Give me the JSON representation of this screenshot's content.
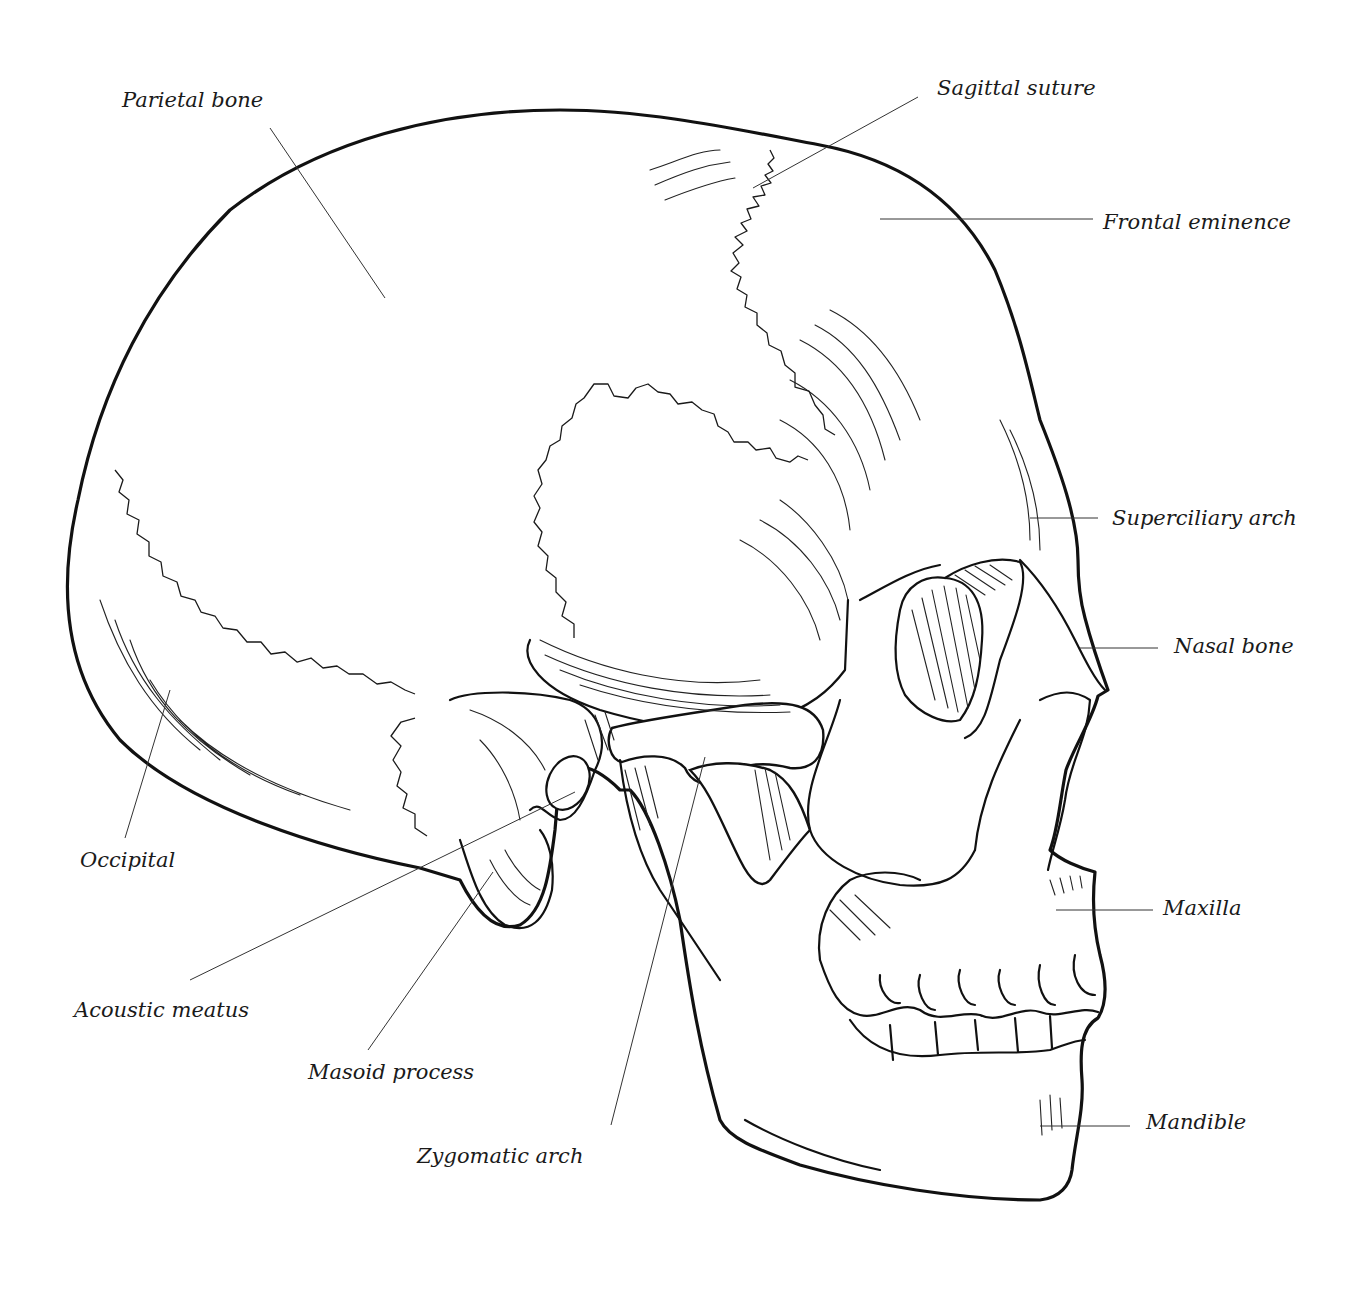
{
  "labels": [
    {
      "id": "parietal-bone",
      "text": "Parietal bone"
    },
    {
      "id": "sagittal-suture",
      "text": "Sagittal suture"
    },
    {
      "id": "frontal-eminence",
      "text": "Frontal eminence"
    },
    {
      "id": "superciliary-arch",
      "text": "Superciliary arch"
    },
    {
      "id": "nasal-bone",
      "text": "Nasal bone"
    },
    {
      "id": "maxilla",
      "text": "Maxilla"
    },
    {
      "id": "mandible",
      "text": "Mandible"
    },
    {
      "id": "occipital",
      "text": "Occipital"
    },
    {
      "id": "acoustic-meatus",
      "text": "Acoustic meatus"
    },
    {
      "id": "masoid-process",
      "text": "Masoid process"
    },
    {
      "id": "zygomatic-arch",
      "text": "Zygomatic arch"
    }
  ],
  "colors": {
    "ink": "#111111",
    "paper": "#ffffff",
    "leader": "#333333"
  }
}
